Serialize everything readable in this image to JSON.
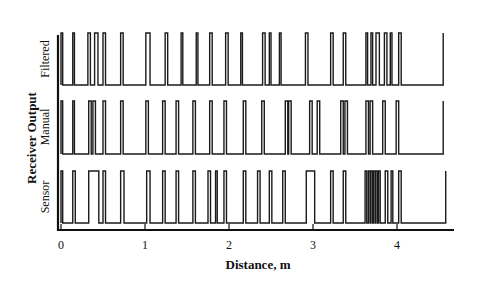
{
  "chart_data": {
    "type": "line",
    "subtype": "digital-pulse-traces",
    "title": "",
    "xlabel": "Distance, m",
    "ylabel": "Receiver Output",
    "xlim": [
      0,
      4.6
    ],
    "x_ticks": [
      0,
      1,
      2,
      3,
      4
    ],
    "x_tick_labels": [
      "0",
      "1",
      "2",
      "3",
      "4"
    ],
    "grid": false,
    "legend": null,
    "series": [
      {
        "name": "Filtered",
        "end_x": 4.55,
        "pulses_m": [
          [
            0.0,
            0.02
          ],
          [
            0.14,
            0.16
          ],
          [
            0.32,
            0.35
          ],
          [
            0.4,
            0.44
          ],
          [
            0.5,
            0.53
          ],
          [
            0.71,
            0.74
          ],
          [
            1.01,
            1.06
          ],
          [
            1.24,
            1.27
          ],
          [
            1.43,
            1.45
          ],
          [
            1.61,
            1.63
          ],
          [
            1.77,
            1.8
          ],
          [
            1.96,
            1.99
          ],
          [
            2.14,
            2.16
          ],
          [
            2.4,
            2.43
          ],
          [
            2.48,
            2.5
          ],
          [
            2.6,
            2.62
          ],
          [
            2.91,
            2.94
          ],
          [
            3.21,
            3.24
          ],
          [
            3.36,
            3.39
          ],
          [
            3.63,
            3.65
          ],
          [
            3.69,
            3.71
          ],
          [
            3.75,
            3.79
          ],
          [
            3.85,
            3.88
          ],
          [
            3.92,
            3.94
          ],
          [
            4.02,
            4.05
          ]
        ]
      },
      {
        "name": "Manual",
        "end_x": 4.55,
        "pulses_m": [
          [
            0.0,
            0.02
          ],
          [
            0.14,
            0.16
          ],
          [
            0.33,
            0.36
          ],
          [
            0.38,
            0.41
          ],
          [
            0.5,
            0.53
          ],
          [
            0.71,
            0.74
          ],
          [
            1.01,
            1.04
          ],
          [
            1.21,
            1.24
          ],
          [
            1.37,
            1.4
          ],
          [
            1.57,
            1.6
          ],
          [
            1.77,
            1.8
          ],
          [
            1.94,
            1.97
          ],
          [
            2.17,
            2.2
          ],
          [
            2.39,
            2.42
          ],
          [
            2.67,
            2.7
          ],
          [
            2.71,
            2.74
          ],
          [
            2.96,
            2.99
          ],
          [
            3.05,
            3.08
          ],
          [
            3.33,
            3.36
          ],
          [
            3.38,
            3.41
          ],
          [
            3.63,
            3.66
          ],
          [
            3.68,
            3.71
          ],
          [
            3.83,
            3.86
          ],
          [
            3.99,
            4.02
          ]
        ]
      },
      {
        "name": "Sensor",
        "end_x": 4.58,
        "pulses_m": [
          [
            0.0,
            0.02
          ],
          [
            0.14,
            0.17
          ],
          [
            0.33,
            0.45
          ],
          [
            0.5,
            0.53
          ],
          [
            0.71,
            0.75
          ],
          [
            1.02,
            1.06
          ],
          [
            1.21,
            1.24
          ],
          [
            1.37,
            1.4
          ],
          [
            1.57,
            1.6
          ],
          [
            1.75,
            1.78
          ],
          [
            1.84,
            1.86
          ],
          [
            1.94,
            1.97
          ],
          [
            2.17,
            2.2
          ],
          [
            2.34,
            2.37
          ],
          [
            2.48,
            2.51
          ],
          [
            2.64,
            2.67
          ],
          [
            2.92,
            3.02
          ],
          [
            3.21,
            3.24
          ],
          [
            3.36,
            3.39
          ],
          [
            3.62,
            3.64
          ],
          [
            3.66,
            3.68
          ],
          [
            3.69,
            3.71
          ],
          [
            3.72,
            3.74
          ],
          [
            3.75,
            3.77
          ],
          [
            3.78,
            3.8
          ],
          [
            3.86,
            3.89
          ],
          [
            3.93,
            3.95
          ],
          [
            4.02,
            4.05
          ]
        ]
      }
    ]
  },
  "labels": {
    "xlabel": "Distance, m",
    "ylabel": "Receiver Output",
    "series": [
      "Filtered",
      "Manual",
      "Sensor"
    ],
    "ticks": [
      "0",
      "1",
      "2",
      "3",
      "4"
    ]
  }
}
